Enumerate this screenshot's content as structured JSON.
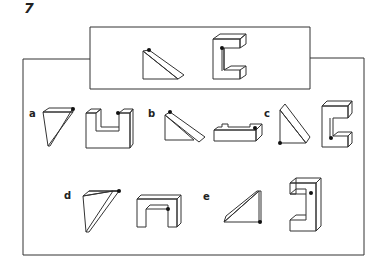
{
  "question": {
    "number": "7"
  },
  "reference": {
    "description": "Given pair: a wedge (triangular prism) and a C-shaped block, each marked with a black dot"
  },
  "options": [
    {
      "label": "a"
    },
    {
      "label": "b"
    },
    {
      "label": "c"
    },
    {
      "label": "d"
    },
    {
      "label": "e"
    }
  ]
}
